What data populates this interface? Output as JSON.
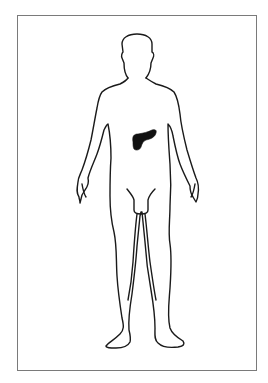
{
  "diagram": {
    "type": "anatomical-body-outline",
    "view": "anterior",
    "highlighted_organ": "pancreas",
    "colors": {
      "outline": "#1a1a1a",
      "organ_fill": "#111111",
      "frame_border": "#7a7a7a",
      "background": "#ffffff"
    }
  }
}
